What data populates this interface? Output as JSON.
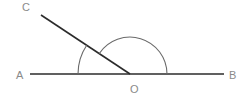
{
  "diagram": {
    "type": "geometry-angles",
    "points": {
      "A": {
        "label": "A",
        "x": 30,
        "y": 74
      },
      "B": {
        "label": "B",
        "x": 224,
        "y": 74
      },
      "C": {
        "label": "C",
        "x": 41,
        "y": 15
      },
      "O": {
        "label": "O",
        "x": 130,
        "y": 74
      }
    },
    "segments": [
      "AB",
      "OC"
    ],
    "angle_marks": [
      {
        "name": "angle-AOC",
        "vertex": "O",
        "radius": 52
      },
      {
        "name": "angle-COB",
        "vertex": "O",
        "radius": 37
      }
    ],
    "colors": {
      "line": "#2b2b2b",
      "arc": "#6a6a6a",
      "label": "#8a8a8a"
    }
  }
}
